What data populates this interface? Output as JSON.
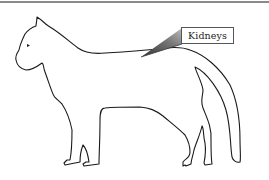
{
  "diagram": {
    "callout": {
      "label": "Kidneys",
      "pointer_color": "#555555"
    },
    "colors": {
      "outline": "#1a1a1a",
      "background": "#ffffff",
      "top_rule": "#8a8a8a"
    }
  }
}
